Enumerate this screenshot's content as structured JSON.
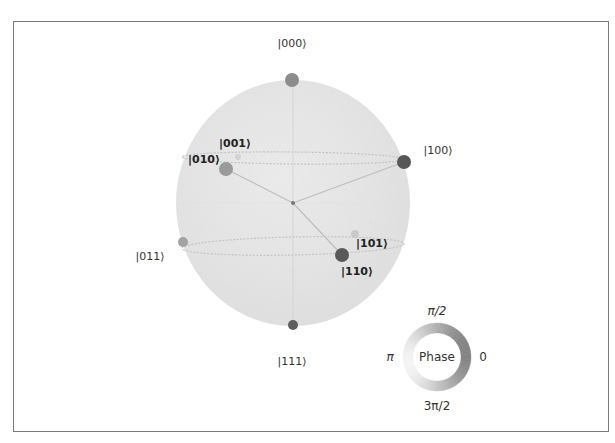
{
  "chart_data": {
    "type": "qsphere",
    "title": "",
    "num_qubits": 3,
    "states": [
      {
        "label": "|000⟩",
        "x": 292,
        "y": 80,
        "r": 7,
        "color": "#8c8c8c",
        "label_x": 292,
        "label_y": 43,
        "bold": false
      },
      {
        "label": "|001⟩",
        "x": 238,
        "y": 157,
        "r": 3,
        "color": "#d2d2d2",
        "label_x": 235,
        "label_y": 143,
        "bold": true
      },
      {
        "label": "|010⟩",
        "x": 226,
        "y": 169,
        "r": 7,
        "color": "#9a9a9a",
        "label_x": 204,
        "label_y": 159,
        "bold": true
      },
      {
        "label": "|100⟩",
        "x": 404,
        "y": 162,
        "r": 7,
        "color": "#575757",
        "label_x": 438,
        "label_y": 150,
        "bold": false
      },
      {
        "label": "|011⟩",
        "x": 183,
        "y": 242,
        "r": 5,
        "color": "#a3a3a3",
        "label_x": 150,
        "label_y": 256,
        "bold": false
      },
      {
        "label": "|101⟩",
        "x": 355,
        "y": 234,
        "r": 4,
        "color": "#c9c9c9",
        "label_x": 372,
        "label_y": 243,
        "bold": true
      },
      {
        "label": "|110⟩",
        "x": 342,
        "y": 255,
        "r": 7,
        "color": "#595959",
        "label_x": 357,
        "label_y": 271,
        "bold": true
      },
      {
        "label": "|111⟩",
        "x": 293,
        "y": 325,
        "r": 5,
        "color": "#5e5e5e",
        "label_x": 292,
        "label_y": 361,
        "bold": false
      }
    ],
    "sphere": {
      "cx": 293,
      "cy": 203,
      "rx": 117,
      "ry": 123,
      "fill": "#e9e9e9"
    },
    "rings": [
      {
        "cx": 293,
        "cy": 158,
        "rx": 111,
        "ry": 6,
        "rotate": 0.6
      },
      {
        "cx": 293,
        "cy": 246,
        "rx": 111,
        "ry": 9,
        "rotate": -1.2
      }
    ],
    "vectors_from_center": [
      "|100⟩",
      "|110⟩",
      "|010⟩"
    ],
    "legend": {
      "title": "Phase",
      "ticks": {
        "top": "π/2",
        "right": "0",
        "left": "π",
        "bottom": "3π/2"
      },
      "cx": 437,
      "cy": 357,
      "r_outer": 34,
      "r_inner": 24
    }
  }
}
